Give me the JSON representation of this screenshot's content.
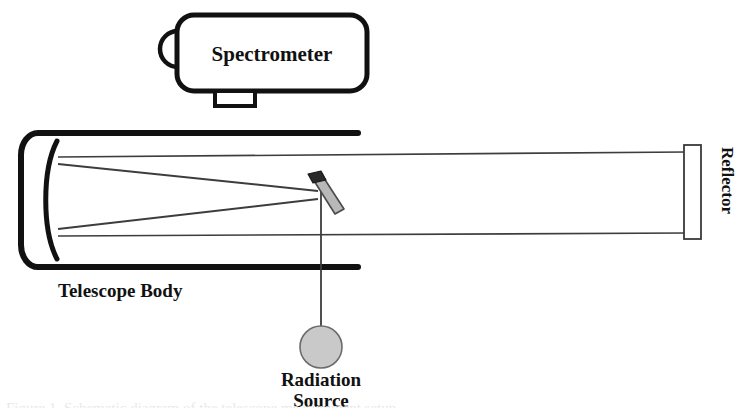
{
  "figure": {
    "background_color": "#ffffff",
    "line_color": "#111111",
    "ray_color": "#4a4a4a",
    "fill_grey": "#c9c9c9"
  },
  "labels": {
    "spectrometer": "Spectrometer",
    "telescope_body": "Telescope Body",
    "radiation_source_line1": "Radiation",
    "radiation_source_line2": "Source",
    "reflector": "Reflector"
  },
  "caption": {
    "clipped_text": "Figure 1. Schematic diagram of the telescope measurement setup"
  },
  "components": [
    {
      "name": "spectrometer",
      "label": "Spectrometer",
      "shape": "rounded-rectangle-with-hood-and-foot",
      "x": 175,
      "y": 14,
      "width": 195,
      "height": 77
    },
    {
      "name": "telescope-body",
      "label": "Telescope Body",
      "shape": "open-tube-with-rounded-end-cap",
      "x": 18,
      "y": 130,
      "width": 340,
      "height": 140
    },
    {
      "name": "primary-mirror",
      "label": "",
      "shape": "concave-arc",
      "x": 40,
      "y": 142,
      "width": 18,
      "height": 116
    },
    {
      "name": "diagonal-mirror",
      "label": "",
      "shape": "tilted-parallelogram",
      "x": 308,
      "y": 175,
      "width": 34,
      "height": 42
    },
    {
      "name": "radiation-source",
      "label": "Radiation Source",
      "shape": "filled-circle",
      "x": 320,
      "y": 325,
      "width": 42,
      "height": 42
    },
    {
      "name": "reflector",
      "label": "Reflector",
      "shape": "tall-outlined-rectangle",
      "x": 684,
      "y": 145,
      "width": 17,
      "height": 94
    }
  ],
  "rays": [
    {
      "name": "upper-horizontal-ray",
      "from": [
        58,
        157
      ],
      "to": [
        686,
        152
      ]
    },
    {
      "name": "lower-horizontal-ray",
      "from": [
        58,
        236
      ],
      "to": [
        686,
        233
      ]
    },
    {
      "name": "upper-converging-ray",
      "from": [
        58,
        164
      ],
      "to": [
        316,
        192
      ]
    },
    {
      "name": "lower-converging-ray",
      "from": [
        58,
        228
      ],
      "to": [
        316,
        198
      ]
    },
    {
      "name": "source-to-mirror-ray",
      "from": [
        322,
        192
      ],
      "to": [
        322,
        325
      ]
    }
  ]
}
